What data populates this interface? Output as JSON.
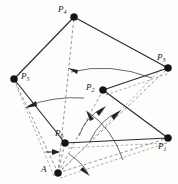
{
  "figure": {
    "background_color": "#fdfdfc",
    "width": 178,
    "height": 184,
    "solid_line_color": "#2b2b2b",
    "dashed_line_color": "#6a6a6a",
    "vertex_color": "#141414",
    "arc_color": "#3a3a3a"
  },
  "vertices": [
    {
      "id": "A",
      "label": "A",
      "sub": "",
      "x": 58,
      "y": 173,
      "label_x": 41,
      "label_y": 166,
      "radius": 3.6
    },
    {
      "id": "P1",
      "label": "P",
      "sub": "1",
      "x": 168,
      "y": 138,
      "label_x": 158,
      "label_y": 143,
      "radius": 3.6
    },
    {
      "id": "P2",
      "label": "P",
      "sub": "2",
      "x": 103,
      "y": 90,
      "label_x": 86,
      "label_y": 84,
      "radius": 3.6
    },
    {
      "id": "P3",
      "label": "P",
      "sub": "3",
      "x": 168,
      "y": 68,
      "label_x": 157,
      "label_y": 54,
      "radius": 3.6
    },
    {
      "id": "P4",
      "label": "P",
      "sub": "4",
      "x": 74,
      "y": 17,
      "label_x": 58,
      "label_y": 6,
      "radius": 3.6
    },
    {
      "id": "P5",
      "label": "P",
      "sub": "5",
      "x": 14,
      "y": 79,
      "label_x": 21,
      "label_y": 73,
      "radius": 3.6
    },
    {
      "id": "P6",
      "label": "P",
      "sub": "6",
      "x": 65,
      "y": 143,
      "label_x": 55,
      "label_y": 130,
      "radius": 3.6
    }
  ],
  "solid_edges": [
    {
      "name": "edge-P5-P4",
      "from": "P5",
      "to": "P4"
    },
    {
      "name": "edge-P4-P3",
      "from": "P4",
      "to": "P3"
    },
    {
      "name": "edge-P3-P2",
      "from": "P3",
      "to": "P2"
    },
    {
      "name": "edge-P2-P1",
      "from": "P2",
      "to": "P1"
    },
    {
      "name": "edge-P1-P6",
      "from": "P1",
      "to": "P6"
    },
    {
      "name": "edge-P6-P5",
      "from": "P6",
      "to": "P5"
    }
  ],
  "dashed_edges": [
    {
      "name": "ray-A-P1",
      "from": "A",
      "to": "P1"
    },
    {
      "name": "ray-A-P2",
      "from": "A",
      "to": "P2"
    },
    {
      "name": "ray-A-P3",
      "from": "A",
      "to": "P3"
    },
    {
      "name": "ray-A-P4",
      "from": "A",
      "to": "P4"
    },
    {
      "name": "ray-A-P5",
      "from": "A",
      "to": "P5"
    },
    {
      "name": "ray-A-P6",
      "from": "A",
      "to": "P6"
    }
  ],
  "dashed_chords": [
    {
      "name": "chord-P5-A-left",
      "from": "P5",
      "to": "A"
    },
    {
      "name": "chord-P6-P1-lower",
      "from": "P6",
      "to": "P1"
    },
    {
      "name": "chord-P2-P3-lower",
      "from": "P2",
      "to": "P3"
    },
    {
      "name": "chord-A-P1-lower",
      "from": "A",
      "to": "P1"
    }
  ],
  "arcs": [
    {
      "name": "arc-P4-sector",
      "radius": 113,
      "start_deg": 243,
      "end_deg": 266,
      "arrow_at": "start",
      "arrow_deg": 243
    },
    {
      "name": "arc-P5-sector",
      "radius": 97,
      "start_deg": 207,
      "end_deg": 236,
      "arrow_at": "start",
      "arrow_deg": 207
    },
    {
      "name": "arc-P2-sector",
      "radius": 58,
      "start_deg": 290,
      "end_deg": 318,
      "arrow_at": "end",
      "arrow_deg": 318
    },
    {
      "name": "arc-P6-sector",
      "radius": 42,
      "start_deg": 262,
      "end_deg": 300,
      "arrow_at": "end",
      "arrow_deg": 300
    },
    {
      "name": "arc-P1-sector",
      "radius": 74,
      "start_deg": 300,
      "end_deg": 342,
      "arrow_at": "start",
      "arrow_deg": 303
    },
    {
      "name": "arc-P3-sector",
      "radius": 30,
      "start_deg": 270,
      "end_deg": 330,
      "arrow_at": "start",
      "arrow_deg": 272
    }
  ],
  "markers": [
    {
      "name": "tick-arrow-P6-left",
      "x1": 46,
      "y1": 152,
      "x2": 60,
      "y2": 152,
      "direction": "right"
    },
    {
      "name": "tick-arrow-P4-stem",
      "x1": 68,
      "y1": 68,
      "x2": 80,
      "y2": 68,
      "direction": "left"
    }
  ],
  "angle_labels": []
}
